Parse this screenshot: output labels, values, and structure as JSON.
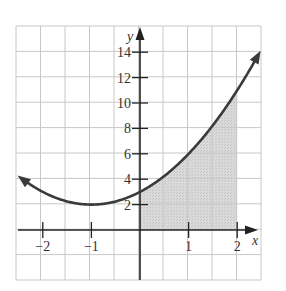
{
  "chart_data": {
    "type": "line",
    "title": "",
    "xlabel": "x",
    "ylabel": "y",
    "function": "y = x^2 + 2x + 3",
    "xlim": [
      -2.5,
      2.5
    ],
    "ylim": [
      -4,
      16
    ],
    "grid": true,
    "x": [
      -2.5,
      -2,
      -1.5,
      -1,
      -0.5,
      0,
      0.5,
      1,
      1.5,
      2,
      2.4
    ],
    "series": [
      {
        "name": "curve",
        "values": [
          4.25,
          3,
          2.25,
          2,
          2.25,
          3,
          4.25,
          6,
          8.25,
          11,
          13.56
        ]
      }
    ],
    "shaded_region": {
      "from_x": 0,
      "to_x": 2,
      "under": "curve",
      "color": "#d4d4d4"
    },
    "x_ticks": [
      {
        "value": -2,
        "label": "−2"
      },
      {
        "value": -1,
        "label": "−1"
      },
      {
        "value": 1,
        "label": "1"
      },
      {
        "value": 2,
        "label": "2"
      }
    ],
    "y_ticks": [
      {
        "value": 2,
        "label": "2"
      },
      {
        "value": 4,
        "label": "4"
      },
      {
        "value": 6,
        "label": "6"
      },
      {
        "value": 8,
        "label": "8"
      },
      {
        "value": 10,
        "label": "10"
      },
      {
        "value": 12,
        "label": "12"
      },
      {
        "value": 14,
        "label": "14"
      }
    ],
    "colors": {
      "curve": "#3a3a3a",
      "axes": "#222222",
      "grid": "#c8c8c8",
      "shade": "#d4d4d4"
    }
  }
}
